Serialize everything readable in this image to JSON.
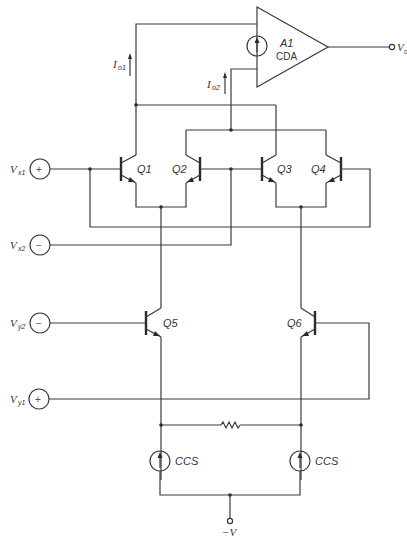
{
  "diagram": {
    "type": "circuit-schematic",
    "amplifier": {
      "name": "A1",
      "type": "CDA",
      "output_label": "V",
      "output_sub": "o"
    },
    "currents": [
      {
        "label": "I",
        "sub": "o1"
      },
      {
        "label": "I",
        "sub": "o2"
      }
    ],
    "inputs": [
      {
        "label": "V",
        "sub": "x1",
        "sign": "+"
      },
      {
        "label": "V",
        "sub": "x2",
        "sign": "−"
      },
      {
        "label": "V",
        "sub": "y2",
        "sign": "−"
      },
      {
        "label": "V",
        "sub": "y1",
        "sign": "+"
      }
    ],
    "transistors": [
      {
        "label": "Q1"
      },
      {
        "label": "Q2"
      },
      {
        "label": "Q3"
      },
      {
        "label": "Q4"
      },
      {
        "label": "Q5"
      },
      {
        "label": "Q6"
      }
    ],
    "current_sources": [
      {
        "label": "CCS"
      },
      {
        "label": "CCS"
      }
    ],
    "supply": {
      "label": "−V"
    }
  }
}
